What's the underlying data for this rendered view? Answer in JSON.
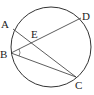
{
  "diagram": {
    "type": "circle-geometry",
    "circle": {
      "cx": 51,
      "cy": 47,
      "r": 40
    },
    "points": [
      {
        "name": "A",
        "x": 13,
        "y": 29,
        "lx": 1,
        "ly": 28
      },
      {
        "name": "B",
        "x": 11,
        "y": 53,
        "lx": 0,
        "ly": 58
      },
      {
        "name": "C",
        "x": 76,
        "y": 77,
        "lx": 75,
        "ly": 89
      },
      {
        "name": "D",
        "x": 81,
        "y": 18,
        "lx": 82,
        "ly": 20
      },
      {
        "name": "E",
        "x": 35,
        "y": 42,
        "lx": 31,
        "ly": 38
      }
    ],
    "segments": [
      [
        "A",
        "C"
      ],
      [
        "B",
        "D"
      ],
      [
        "B",
        "C"
      ]
    ],
    "angle_marker": {
      "at": "B",
      "between": [
        "D",
        "C"
      ]
    },
    "stroke_color": "#333333"
  }
}
